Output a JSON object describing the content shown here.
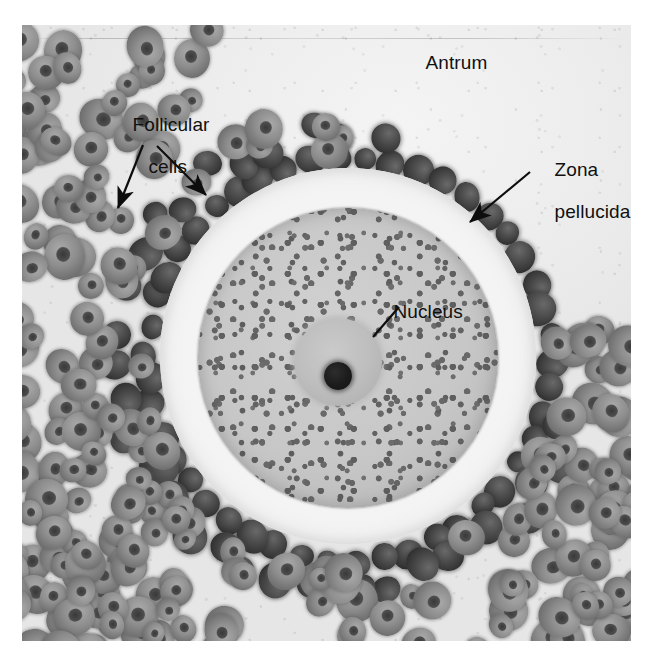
{
  "figure": {
    "kind": "light-micrograph",
    "stain_palette": {
      "antrum": "#e9e9e9",
      "ooplasm": "#c6c6c6",
      "nucleus": "#bdbdbd",
      "nucleolus": "#1d1d1d",
      "corona_cells": "#3a3a3a",
      "granulosa_cells": "#8e8e8e",
      "label_text": "#101010",
      "plate_border": "#ffffff"
    }
  },
  "labels": {
    "antrum": "Antrum",
    "follicular_line1": "Follicular",
    "follicular_line2": "cells",
    "zona_line1": "Zona",
    "zona_line2": "pellucida",
    "nucleus": "Nucleus"
  },
  "annotations": [
    {
      "id": "antrum",
      "text": "Antrum",
      "text_x": 405,
      "text_y": 33,
      "leader": "none"
    },
    {
      "id": "follicular-cells",
      "text": "Follicular cells",
      "text_x": 113,
      "text_y": 95,
      "leader": "two-arrows",
      "arrows": [
        {
          "x1": 143,
          "y1": 145,
          "x2": 118,
          "y2": 208
        },
        {
          "x1": 157,
          "y1": 146,
          "x2": 206,
          "y2": 195
        }
      ]
    },
    {
      "id": "zona-pellucida",
      "text": "Zona pellucida",
      "text_x": 534,
      "text_y": 140,
      "leader": "arrow",
      "arrows": [
        {
          "x1": 530,
          "y1": 172,
          "x2": 470,
          "y2": 222
        }
      ]
    },
    {
      "id": "nucleus",
      "text": "Nucleus",
      "text_x": 373,
      "text_y": 282,
      "leader": "line",
      "arrows": [
        {
          "x1": 399,
          "y1": 307,
          "x2": 373,
          "y2": 337
        }
      ]
    }
  ],
  "structures": {
    "oocyte": {
      "cx": 348,
      "cy": 358,
      "r": 150
    },
    "zona_pellucida": {
      "cx": 348,
      "cy": 356,
      "r": 188
    },
    "nucleus": {
      "cx": 338,
      "cy": 362,
      "r": 44
    },
    "nucleolus": {
      "cx": 338,
      "cy": 376,
      "r": 14
    }
  }
}
